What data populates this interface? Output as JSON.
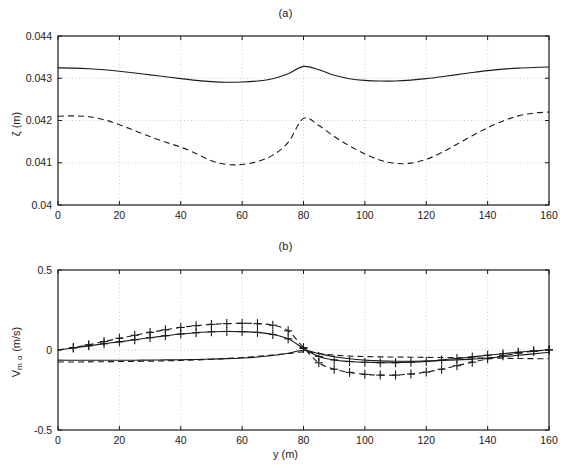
{
  "figure": {
    "width": 571,
    "height": 469,
    "background": "#ffffff",
    "line_color": "#1a1a1a"
  },
  "panels": [
    {
      "id": "a",
      "title": "(a)",
      "plot_box": {
        "left": 58,
        "top": 36,
        "right": 549,
        "bottom": 205
      }
    },
    {
      "id": "b",
      "title": "(b)",
      "plot_box": {
        "left": 58,
        "top": 270,
        "right": 549,
        "bottom": 430
      }
    }
  ],
  "chart_data": [
    {
      "type": "line",
      "panel": "a",
      "title": "(a)",
      "xlabel": "",
      "ylabel": "ζ (m)",
      "ylabel_symbol": "ζ",
      "ylabel_unit": "(m)",
      "xlim": [
        0,
        160
      ],
      "ylim": [
        0.04,
        0.044
      ],
      "xticks": [
        0,
        20,
        40,
        60,
        80,
        100,
        120,
        140,
        160
      ],
      "xticklabels": [
        "0",
        "20",
        "40",
        "60",
        "80",
        "100",
        "120",
        "140",
        "160"
      ],
      "yticks": [
        0.04,
        0.041,
        0.042,
        0.043,
        0.044
      ],
      "yticklabels": [
        "0.04",
        "0.041",
        "0.042",
        "0.043",
        "0.044"
      ],
      "grid": true,
      "grid_style": "dotted",
      "legend": null,
      "x": [
        0,
        5,
        10,
        15,
        20,
        25,
        30,
        35,
        40,
        45,
        50,
        55,
        60,
        65,
        70,
        75,
        80,
        85,
        90,
        95,
        100,
        105,
        110,
        115,
        120,
        125,
        130,
        135,
        140,
        145,
        150,
        155,
        160
      ],
      "series": [
        {
          "name": "solid",
          "style": "solid",
          "marker": "none",
          "values": [
            0.043245,
            0.04324,
            0.043225,
            0.0432,
            0.043165,
            0.043125,
            0.04308,
            0.043035,
            0.04299,
            0.04295,
            0.04292,
            0.042905,
            0.04291,
            0.042935,
            0.04299,
            0.043105,
            0.04328,
            0.0432,
            0.04307,
            0.04299,
            0.04295,
            0.042935,
            0.042935,
            0.042955,
            0.04299,
            0.043035,
            0.043085,
            0.043135,
            0.04318,
            0.043215,
            0.04324,
            0.043255,
            0.043265
          ]
        },
        {
          "name": "dashed",
          "style": "dashed",
          "marker": "none",
          "values": [
            0.0421,
            0.04211,
            0.04209,
            0.04202,
            0.0419,
            0.04176,
            0.04162,
            0.04149,
            0.04137,
            0.04122,
            0.041045,
            0.04096,
            0.04096,
            0.04103,
            0.04118,
            0.04148,
            0.04205,
            0.04188,
            0.04162,
            0.0414,
            0.04121,
            0.04106,
            0.040985,
            0.04099,
            0.04108,
            0.04124,
            0.04144,
            0.04164,
            0.04183,
            0.04199,
            0.04211,
            0.042175,
            0.0422
          ]
        }
      ]
    },
    {
      "type": "line",
      "panel": "b",
      "title": "(b)",
      "xlabel": "y (m)",
      "ylabel": "V m α (m/s)",
      "ylabel_symbol": "V",
      "ylabel_subscript": "m α",
      "ylabel_unit": "(m/s)",
      "xlim": [
        0,
        160
      ],
      "ylim": [
        -0.5,
        0.5
      ],
      "xticks": [
        0,
        20,
        40,
        60,
        80,
        100,
        120,
        140,
        160
      ],
      "xticklabels": [
        "0",
        "20",
        "40",
        "60",
        "80",
        "100",
        "120",
        "140",
        "160"
      ],
      "yticks": [
        -0.5,
        0,
        0.5
      ],
      "yticklabels": [
        "-0.5",
        "0",
        "0.5"
      ],
      "grid": true,
      "grid_style": "dotted",
      "legend": null,
      "x": [
        0,
        5,
        10,
        15,
        20,
        25,
        30,
        35,
        40,
        45,
        50,
        55,
        60,
        65,
        70,
        75,
        80,
        85,
        90,
        95,
        100,
        105,
        110,
        115,
        120,
        125,
        130,
        135,
        140,
        145,
        150,
        155,
        160
      ],
      "series": [
        {
          "name": "solid-with-plus",
          "style": "solid",
          "marker": "plus",
          "values": [
            0.0,
            0.013,
            0.026,
            0.039,
            0.051,
            0.064,
            0.077,
            0.089,
            0.1,
            0.108,
            0.114,
            0.116,
            0.115,
            0.11,
            0.097,
            0.07,
            0.01,
            -0.04,
            -0.062,
            -0.072,
            -0.077,
            -0.079,
            -0.079,
            -0.076,
            -0.071,
            -0.063,
            -0.053,
            -0.043,
            -0.033,
            -0.023,
            -0.014,
            -0.006,
            0.002
          ]
        },
        {
          "name": "dashed-with-plus",
          "style": "dashed",
          "marker": "plus",
          "values": [
            0.0,
            0.015,
            0.033,
            0.053,
            0.073,
            0.092,
            0.11,
            0.126,
            0.141,
            0.152,
            0.16,
            0.165,
            0.167,
            0.165,
            0.155,
            0.12,
            0.015,
            -0.08,
            -0.12,
            -0.14,
            -0.152,
            -0.157,
            -0.157,
            -0.15,
            -0.138,
            -0.12,
            -0.098,
            -0.076,
            -0.055,
            -0.036,
            -0.02,
            -0.008,
            0.0
          ]
        },
        {
          "name": "solid-lower",
          "style": "solid",
          "marker": "none",
          "values": [
            -0.063,
            -0.064,
            -0.064,
            -0.064,
            -0.064,
            -0.064,
            -0.063,
            -0.062,
            -0.061,
            -0.059,
            -0.057,
            -0.054,
            -0.05,
            -0.044,
            -0.034,
            -0.02,
            -0.002,
            -0.022,
            -0.042,
            -0.055,
            -0.063,
            -0.068,
            -0.07,
            -0.07,
            -0.069,
            -0.066,
            -0.062,
            -0.057,
            -0.05,
            -0.042,
            -0.033,
            -0.024,
            -0.014
          ]
        },
        {
          "name": "dashed-lower",
          "style": "dashed",
          "marker": "none",
          "values": [
            -0.075,
            -0.075,
            -0.074,
            -0.073,
            -0.072,
            -0.071,
            -0.07,
            -0.068,
            -0.065,
            -0.062,
            -0.058,
            -0.053,
            -0.047,
            -0.04,
            -0.032,
            -0.022,
            -0.012,
            -0.022,
            -0.032,
            -0.038,
            -0.041,
            -0.043,
            -0.044,
            -0.045,
            -0.046,
            -0.047,
            -0.048,
            -0.05,
            -0.051,
            -0.052,
            -0.053,
            -0.054,
            -0.055
          ]
        }
      ]
    }
  ]
}
